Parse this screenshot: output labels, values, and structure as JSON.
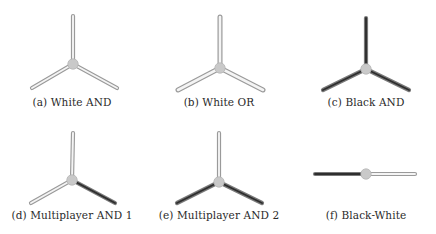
{
  "figure": {
    "colors": {
      "white_wire_outline": "#9a9a9a",
      "white_wire_core": "#f4f4f4",
      "black_wire_outline": "#7a7a7a",
      "black_wire_core": "#2e2e2e",
      "node_fill": "#c9c9c9",
      "node_stroke": "#b5b5b5"
    },
    "panels": [
      {
        "id": "a",
        "caption": "(a) White AND",
        "caption_pos": [
          72,
          106
        ],
        "node": [
          73,
          64
        ],
        "wires": [
          {
            "to": [
              73,
              16
            ],
            "color": "white"
          },
          {
            "to": [
              32,
              88
            ],
            "color": "white"
          },
          {
            "to": [
              117,
              88
            ],
            "color": "white"
          }
        ]
      },
      {
        "id": "b",
        "caption": "(b) White OR",
        "caption_pos": [
          219,
          106
        ],
        "node": [
          220,
          68
        ],
        "wires": [
          {
            "to": [
              220,
              17
            ],
            "color": "white",
            "thick": true
          },
          {
            "to": [
              178,
              90
            ],
            "color": "white",
            "thick": true
          },
          {
            "to": [
              263,
              90
            ],
            "color": "white",
            "thick": true
          }
        ]
      },
      {
        "id": "c",
        "caption": "(c) Black AND",
        "caption_pos": [
          366,
          106
        ],
        "node": [
          366,
          69
        ],
        "wires": [
          {
            "to": [
              366,
              18
            ],
            "color": "black"
          },
          {
            "to": [
              323,
              90
            ],
            "color": "black"
          },
          {
            "to": [
              409,
              90
            ],
            "color": "black"
          }
        ]
      },
      {
        "id": "d",
        "caption": "(d) Multiplayer AND 1",
        "caption_pos": [
          72,
          219
        ],
        "node": [
          72,
          180
        ],
        "wires": [
          {
            "to": [
              73,
              133
            ],
            "color": "white"
          },
          {
            "to": [
              31,
              203
            ],
            "color": "white"
          },
          {
            "to": [
              115,
              203
            ],
            "color": "black"
          }
        ]
      },
      {
        "id": "e",
        "caption": "(e) Multiplayer AND 2",
        "caption_pos": [
          219,
          219
        ],
        "node": [
          219,
          182
        ],
        "wires": [
          {
            "to": [
              219,
              133
            ],
            "color": "white"
          },
          {
            "to": [
              177,
              203
            ],
            "color": "black"
          },
          {
            "to": [
              262,
              203
            ],
            "color": "black"
          }
        ]
      },
      {
        "id": "f",
        "caption": "(f) Black-White",
        "caption_pos": [
          366,
          219
        ],
        "node": [
          366,
          174
        ],
        "wires": [
          {
            "to": [
              315,
              174
            ],
            "color": "black"
          },
          {
            "to": [
              415,
              174
            ],
            "color": "white"
          }
        ]
      }
    ]
  }
}
